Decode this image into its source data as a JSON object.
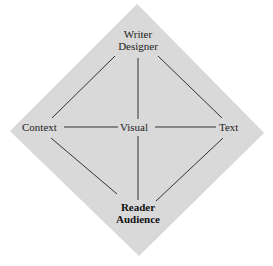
{
  "diagram": {
    "colors": {
      "diamond_fill": "#d9d9d9",
      "diamond_shadow": "#c4c4c4",
      "line": "#333333"
    },
    "nodes": {
      "top": {
        "line1": "Writer",
        "line2": "Designer"
      },
      "left": {
        "label": "Context"
      },
      "center": {
        "label": "Visual"
      },
      "right": {
        "label": "Text"
      },
      "bottom": {
        "line1": "Reader",
        "line2": "Audience"
      }
    }
  }
}
